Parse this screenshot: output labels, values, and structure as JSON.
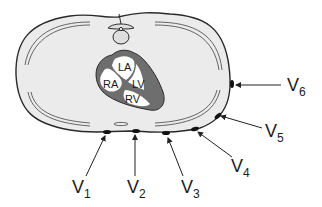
{
  "diagram": {
    "colors": {
      "chest_fill": "#ebebeb",
      "outline": "#2a2a2a",
      "heart_wall": "#6e6e6e",
      "heart_chamber": "#ffffff",
      "electrode": "#111111"
    },
    "heart": {
      "chambers": [
        {
          "id": "LA",
          "label": "LA"
        },
        {
          "id": "RA",
          "label": "RA"
        },
        {
          "id": "LV",
          "label": "LV"
        },
        {
          "id": "RV",
          "label": "RV"
        }
      ]
    },
    "leads": [
      {
        "id": "V1",
        "main": "V",
        "sub": "1"
      },
      {
        "id": "V2",
        "main": "V",
        "sub": "2"
      },
      {
        "id": "V3",
        "main": "V",
        "sub": "3"
      },
      {
        "id": "V4",
        "main": "V",
        "sub": "4"
      },
      {
        "id": "V5",
        "main": "V",
        "sub": "5"
      },
      {
        "id": "V6",
        "main": "V",
        "sub": "6"
      }
    ]
  }
}
